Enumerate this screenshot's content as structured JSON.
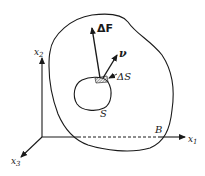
{
  "diagram": {
    "type": "continuum-mechanics-traction-vector",
    "axes": {
      "x1": {
        "label": "x",
        "subscript": "1"
      },
      "x2": {
        "label": "x",
        "subscript": "2"
      },
      "x3": {
        "label": "x",
        "subscript": "3"
      }
    },
    "body": {
      "label": "B"
    },
    "surface": {
      "label": "S"
    },
    "surface_element": {
      "label": "ΔS"
    },
    "force_vector": {
      "label": "ΔF"
    },
    "normal_vector": {
      "label": "ν"
    },
    "colors": {
      "stroke": "#1a1a1a",
      "background": "#ffffff",
      "hatch": "#555555"
    }
  }
}
